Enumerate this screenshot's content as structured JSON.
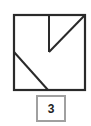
{
  "figure": {
    "type": "square-with-inner-lines",
    "stroke_color": "#2a2a2a",
    "square": {
      "x1": 14,
      "y1": 15,
      "x2": 85,
      "y2": 90
    },
    "lines": [
      {
        "name": "vertical-line",
        "x1": 49,
        "y1": 15,
        "x2": 49,
        "y2": 52
      },
      {
        "name": "upper-diagonal",
        "x1": 49,
        "y1": 52,
        "x2": 85,
        "y2": 15
      },
      {
        "name": "lower-diagonal",
        "x1": 14,
        "y1": 52,
        "x2": 48,
        "y2": 90
      }
    ]
  },
  "label": {
    "text": "3",
    "border_color": "#a0a0a0"
  }
}
